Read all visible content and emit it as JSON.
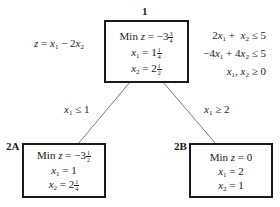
{
  "objective": {
    "lhs": "z",
    "expr": "x1 − 2x2"
  },
  "constraints": [
    "2x1 +  x2 ≤ 5",
    "−4x1 + 4x2 ≤ 5",
    "x1, x2 ≥ 0"
  ],
  "nodes": [
    {
      "id": "1",
      "min_z": "−3 3/4",
      "min_z_whole": "−3",
      "min_z_num": "3",
      "min_z_den": "4",
      "x1": "1 1/4",
      "x1_whole": "1",
      "x1_num": "1",
      "x1_den": "4",
      "x2": "2 1/2",
      "x2_whole": "2",
      "x2_num": "1",
      "x2_den": "2"
    },
    {
      "id": "2A",
      "min_z": "−3 1/2",
      "min_z_whole": "−3",
      "min_z_num": "1",
      "min_z_den": "2",
      "x1": "1",
      "x2": "2 1/4",
      "x2_whole": "2",
      "x2_num": "1",
      "x2_den": "4"
    },
    {
      "id": "2B",
      "min_z": "0",
      "x1": "2",
      "x2": "1"
    }
  ],
  "edges": [
    {
      "from": "1",
      "to": "2A",
      "label": "x1 ≤ 1",
      "op": "≤",
      "value": "1"
    },
    {
      "from": "1",
      "to": "2B",
      "label": "x1 ≥ 2",
      "op": "≥",
      "value": "2"
    }
  ],
  "text": {
    "min": "Min",
    "z": "z",
    "eq": " = ",
    "x": "x",
    "sub1": "1",
    "sub2": "2"
  }
}
